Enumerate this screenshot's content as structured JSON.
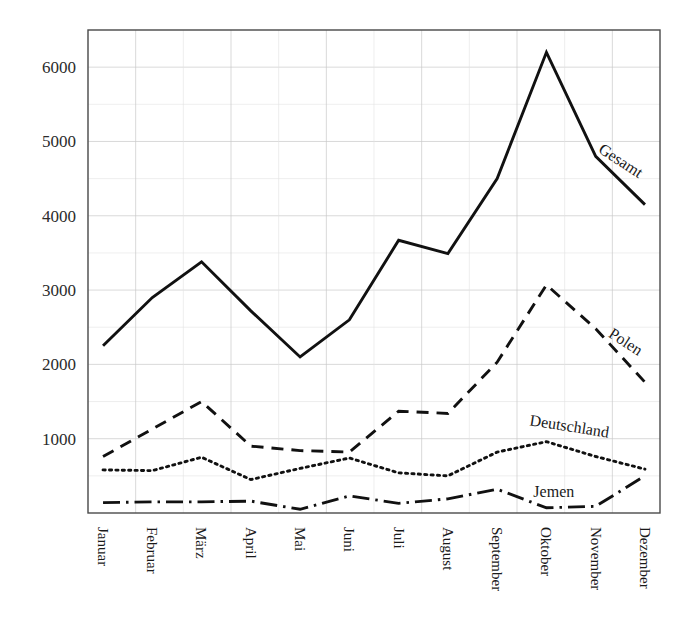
{
  "chart_data": {
    "type": "line",
    "title": "",
    "subtitle": "",
    "xlabel": "",
    "ylabel": "",
    "categories": [
      "Januar",
      "Februar",
      "März",
      "April",
      "Mai",
      "Juni",
      "Juli",
      "August",
      "September",
      "Oktober",
      "November",
      "Dezember"
    ],
    "ylim": [
      0,
      6500
    ],
    "yticks": [
      1000,
      2000,
      3000,
      4000,
      5000,
      6000
    ],
    "ytick_labels": [
      "1000",
      "2000",
      "3000",
      "4000",
      "5000",
      "6000"
    ],
    "grid": "major and minor horizontal gridlines every 500; vertical gridlines at every second month",
    "legend_position": "inline labels at right end of each series",
    "series": [
      {
        "name": "Gesamt",
        "style": "solid",
        "values": [
          2250,
          2900,
          3380,
          2720,
          2100,
          2600,
          3670,
          3490,
          4500,
          6200,
          4800,
          4150
        ]
      },
      {
        "name": "Polen",
        "style": "dashed",
        "values": [
          760,
          1130,
          1500,
          900,
          840,
          820,
          1370,
          1340,
          2030,
          3070,
          2480,
          1760
        ]
      },
      {
        "name": "Deutschland",
        "style": "dotted",
        "values": [
          580,
          570,
          750,
          450,
          600,
          740,
          540,
          500,
          820,
          960,
          760,
          590
        ]
      },
      {
        "name": "Jemen",
        "style": "dash-dot",
        "values": [
          140,
          150,
          150,
          160,
          50,
          230,
          130,
          190,
          320,
          70,
          90,
          500
        ]
      }
    ],
    "annotations": [
      {
        "text": "Gesamt",
        "series": "Gesamt",
        "rotation": 33
      },
      {
        "text": "Polen",
        "series": "Polen",
        "rotation": 33
      },
      {
        "text": "Deutschland",
        "series": "Deutschland",
        "rotation": 9
      },
      {
        "text": "Jemen",
        "series": "Jemen",
        "rotation": 0
      }
    ]
  },
  "colors": {
    "line": "#111111",
    "grid_major": "#c8c8c8",
    "grid_minor": "#e2e2e2",
    "frame": "#4a4a4a",
    "text": "#1a1a1a",
    "background": "#ffffff"
  }
}
